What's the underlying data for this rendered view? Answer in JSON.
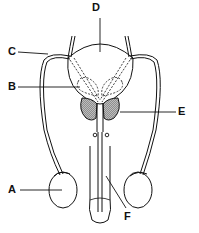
{
  "diagram": {
    "type": "anatomical line drawing",
    "labels": [
      {
        "id": "A",
        "text": "A",
        "x": 12,
        "y": 76
      },
      {
        "id": "B",
        "text": "B",
        "x": 12,
        "y": 83
      },
      {
        "id": "C",
        "text": "C",
        "x": 12,
        "y": 48
      },
      {
        "id": "D",
        "text": "D",
        "x": 96,
        "y": 9
      },
      {
        "id": "E",
        "text": "E",
        "x": 180,
        "y": 105
      },
      {
        "id": "F",
        "text": "F",
        "x": 127,
        "y": 214
      }
    ],
    "colors": {
      "line": "#111111",
      "hatch": "#9a9a9a",
      "background": "#ffffff"
    }
  }
}
